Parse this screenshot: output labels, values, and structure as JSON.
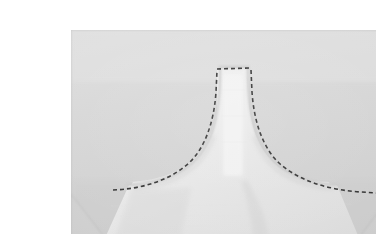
{
  "page": {
    "background_color": "#ffffff",
    "width": 376,
    "height": 234
  },
  "photo": {
    "subject": "sewing-detail-garment-neckline",
    "description": "Close-up photograph of a pale white fabric garment piece laid flat on a light grey surface, showing a V-shaped yoke / neckline panel traced by a hand-basted dashed stitching line.",
    "frame": {
      "left": 31,
      "top": 14,
      "width": 319,
      "height": 208
    },
    "colors": {
      "surface_background": "#d4d4d4",
      "surface_background_light": "#dcdcdc",
      "fabric_light": "#ebebeb",
      "fabric_mid": "#e2e2e2",
      "fabric_shadow": "#cfcfcf",
      "fabric_highlight": "#f4f4f4",
      "stitch_line": "#2e2e2e",
      "seam_edge": "#c8c8c8"
    },
    "elements": [
      {
        "name": "garment-panel",
        "label": "White fabric garment panel",
        "note": "Central raised neck column flaring into two shoulder wings"
      },
      {
        "name": "basting-stitch-line",
        "label": "Dashed basting stitch line",
        "note": "Dashed dark thread traced along the top edge of the neck column and down both shoulder curves"
      },
      {
        "name": "neck-column",
        "label": "Neck / collar stand column"
      },
      {
        "name": "left-shoulder-curve",
        "label": "Left shoulder seam curve"
      },
      {
        "name": "right-shoulder-curve",
        "label": "Right shoulder seam curve"
      },
      {
        "name": "lower-fabric-body",
        "label": "Lower garment body with diagonal folded corners"
      }
    ],
    "stitch": {
      "dash_pattern": "4 3",
      "stroke_width": 1.6,
      "color": "#2e2e2e"
    }
  }
}
